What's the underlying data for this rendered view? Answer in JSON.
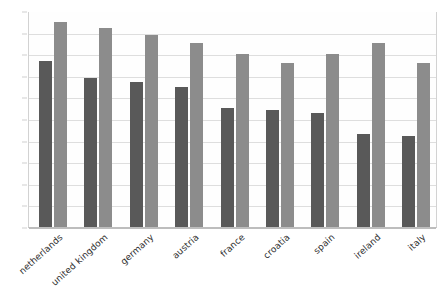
{
  "chart_data": {
    "type": "bar",
    "title": "",
    "subtitle": "",
    "xlabel": "",
    "ylabel": "",
    "ylim": [
      0,
      100
    ],
    "yticks": [
      0,
      10,
      20,
      30,
      40,
      50,
      60,
      70,
      80,
      90,
      100
    ],
    "grid": true,
    "legend": "none",
    "categories": [
      "netherlands",
      "united kingdom",
      "germany",
      "austria",
      "france",
      "croatia",
      "spain",
      "ireland",
      "italy"
    ],
    "series": [
      {
        "name": "series-1",
        "color": "#595959",
        "values": [
          77,
          69,
          67,
          65,
          55,
          54,
          53,
          43,
          42
        ]
      },
      {
        "name": "series-2",
        "color": "#8c8c8c",
        "values": [
          95,
          92,
          89,
          85,
          80,
          76,
          80,
          85,
          76
        ]
      }
    ]
  },
  "colors": {
    "series_1": "#595959",
    "series_2": "#8c8c8c",
    "gridline": "#dedede",
    "axis": "#bdbdbd",
    "tick_text": "#3b3b3b",
    "label_text": "#2e2e2e",
    "background": "#ffffff"
  }
}
